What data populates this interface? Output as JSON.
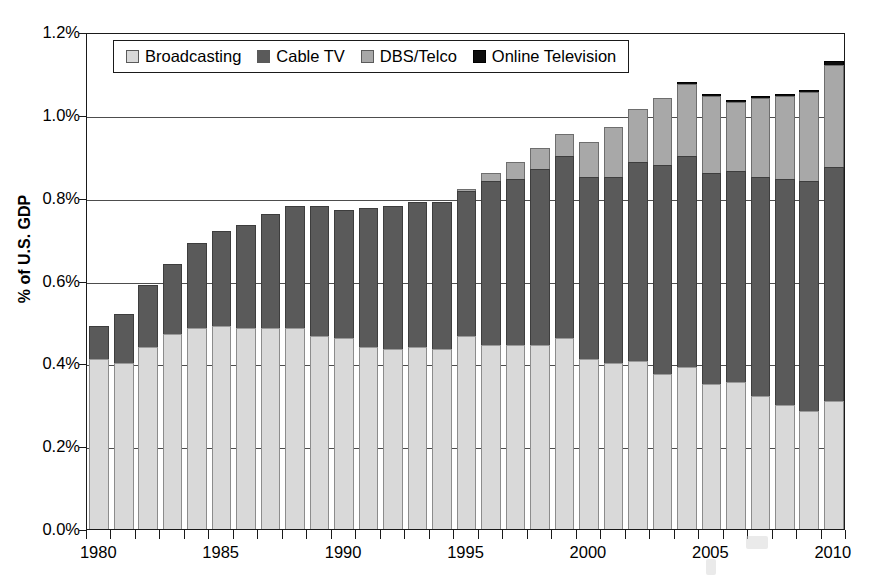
{
  "chart_data": {
    "type": "bar",
    "subtype": "stacked-bar",
    "title": "",
    "xlabel": "",
    "ylabel": "% of U.S. GDP",
    "ylim": [
      0,
      1.2
    ],
    "ytick_labels": [
      "1.2%",
      "1.0%",
      "0.8%",
      "0.6%",
      "0.4%",
      "0.2%",
      "0.0%"
    ],
    "ytick_values": [
      1.2,
      1.0,
      0.8,
      0.6,
      0.4,
      0.2,
      0.0
    ],
    "ytick_suffix": "%",
    "grid": true,
    "legend_position": "top-left-inside",
    "x": [
      1980,
      1981,
      1982,
      1983,
      1984,
      1985,
      1986,
      1987,
      1988,
      1989,
      1990,
      1991,
      1992,
      1993,
      1994,
      1995,
      1996,
      1997,
      1998,
      1999,
      2000,
      2001,
      2002,
      2003,
      2004,
      2005,
      2006,
      2007,
      2008,
      2009,
      2010
    ],
    "xtick_labels": [
      "1980",
      "1985",
      "1990",
      "1995",
      "2000",
      "2005",
      "2010"
    ],
    "xtick_values": [
      1980,
      1985,
      1990,
      1995,
      2000,
      2005,
      2010
    ],
    "categories": [
      "1980",
      "1981",
      "1982",
      "1983",
      "1984",
      "1985",
      "1986",
      "1987",
      "1988",
      "1989",
      "1990",
      "1991",
      "1992",
      "1993",
      "1994",
      "1995",
      "1996",
      "1997",
      "1998",
      "1999",
      "2000",
      "2001",
      "2002",
      "2003",
      "2004",
      "2005",
      "2006",
      "2007",
      "2008",
      "2009",
      "2010"
    ],
    "series": [
      {
        "name": "Broadcasting",
        "color": "#d9d9d9",
        "values": [
          0.41,
          0.4,
          0.44,
          0.47,
          0.485,
          0.49,
          0.485,
          0.485,
          0.485,
          0.465,
          0.46,
          0.44,
          0.435,
          0.44,
          0.435,
          0.465,
          0.445,
          0.445,
          0.445,
          0.46,
          0.41,
          0.4,
          0.405,
          0.375,
          0.39,
          0.35,
          0.355,
          0.32,
          0.3,
          0.285,
          0.31
        ]
      },
      {
        "name": "Cable TV",
        "color": "#5a5a5a",
        "values": [
          0.08,
          0.12,
          0.15,
          0.17,
          0.205,
          0.23,
          0.25,
          0.275,
          0.295,
          0.315,
          0.31,
          0.335,
          0.345,
          0.35,
          0.355,
          0.35,
          0.395,
          0.4,
          0.425,
          0.44,
          0.44,
          0.45,
          0.48,
          0.505,
          0.51,
          0.51,
          0.51,
          0.53,
          0.545,
          0.555,
          0.565
        ]
      },
      {
        "name": "DBS/Telco",
        "color": "#a8a8a8",
        "values": [
          0,
          0,
          0,
          0,
          0,
          0,
          0,
          0,
          0,
          0,
          0,
          0,
          0,
          0,
          0,
          0.005,
          0.02,
          0.04,
          0.05,
          0.055,
          0.085,
          0.12,
          0.13,
          0.16,
          0.175,
          0.185,
          0.165,
          0.19,
          0.2,
          0.215,
          0.245
        ]
      },
      {
        "name": "Online Television",
        "color": "#0d0d0d",
        "values": [
          0,
          0,
          0,
          0,
          0,
          0,
          0,
          0,
          0,
          0,
          0,
          0,
          0,
          0,
          0,
          0,
          0,
          0,
          0,
          0,
          0,
          0,
          0,
          0,
          0.005,
          0.005,
          0.005,
          0.005,
          0.005,
          0.005,
          0.01
        ]
      }
    ],
    "totals": [
      0.49,
      0.52,
      0.59,
      0.64,
      0.69,
      0.72,
      0.735,
      0.76,
      0.78,
      0.78,
      0.77,
      0.775,
      0.78,
      0.79,
      0.79,
      0.82,
      0.86,
      0.885,
      0.92,
      0.955,
      0.935,
      0.97,
      1.015,
      1.04,
      1.08,
      1.05,
      1.035,
      1.045,
      1.05,
      1.06,
      1.13
    ]
  },
  "legend": {
    "items": [
      {
        "label": "Broadcasting",
        "swatch_name": "legend-swatch-broadcasting"
      },
      {
        "label": "Cable TV",
        "swatch_name": "legend-swatch-cable-tv"
      },
      {
        "label": "DBS/Telco",
        "swatch_name": "legend-swatch-dbs-telco"
      },
      {
        "label": "Online Television",
        "swatch_name": "legend-swatch-online-television"
      }
    ]
  }
}
